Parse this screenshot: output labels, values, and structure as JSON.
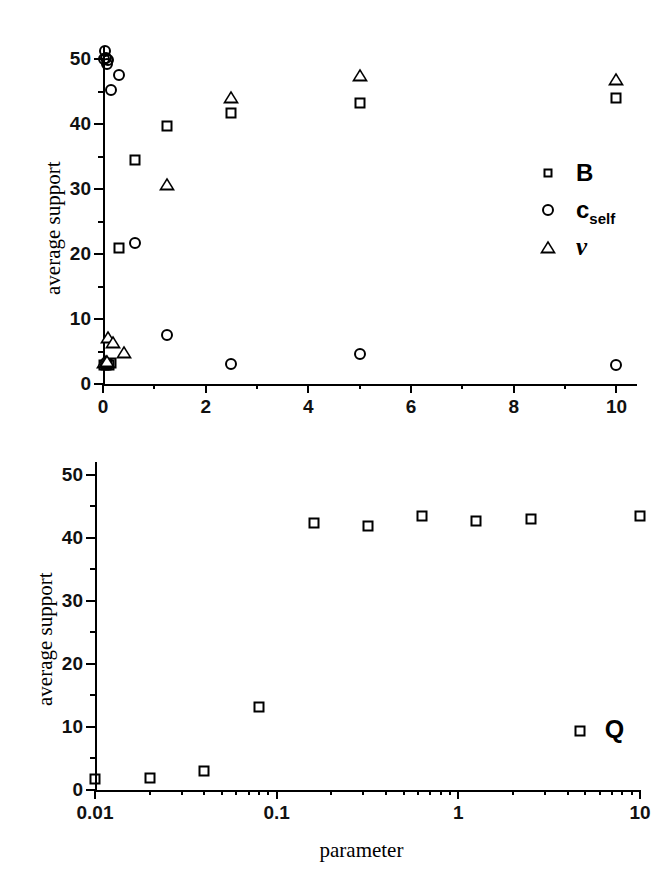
{
  "figure": {
    "panels": [
      {
        "id": "top",
        "ylabel": "average support",
        "xlabel": "",
        "legend": [
          {
            "symbol": "square",
            "label": "B",
            "sub": ""
          },
          {
            "symbol": "circle",
            "label": "c",
            "sub": "self"
          },
          {
            "symbol": "triangle",
            "label": "ν",
            "sub": ""
          }
        ],
        "xticks": [
          "0",
          "2",
          "4",
          "6",
          "8",
          "10"
        ],
        "yticks": [
          "0",
          "10",
          "20",
          "30",
          "40",
          "50"
        ]
      },
      {
        "id": "bottom",
        "ylabel": "average support",
        "xlabel": "parameter",
        "series_tag": "Q",
        "xticks": [
          "0.01",
          "0.1",
          "1",
          "10"
        ],
        "yticks": [
          "0",
          "10",
          "20",
          "30",
          "40",
          "50"
        ]
      }
    ]
  },
  "chart_data": [
    {
      "type": "scatter",
      "panel": "top",
      "title": "",
      "xlabel": "",
      "ylabel": "average support",
      "xscale": "linear",
      "yscale": "linear",
      "xlim": [
        0,
        10.4
      ],
      "ylim": [
        0,
        52
      ],
      "xticks": [
        0,
        2,
        4,
        6,
        8,
        10
      ],
      "yticks": [
        0,
        10,
        20,
        30,
        40,
        50
      ],
      "grid": false,
      "legend_position": "right-middle",
      "series": [
        {
          "name": "B",
          "marker": "square",
          "x": [
            0.02,
            0.05,
            0.08,
            0.12,
            0.16,
            0.31,
            0.62,
            1.25,
            2.5,
            5.0,
            10.0
          ],
          "y": [
            3.0,
            2.9,
            3.1,
            3.0,
            3.2,
            21.0,
            34.5,
            39.7,
            41.7,
            43.2,
            44.0
          ]
        },
        {
          "name": "c_self",
          "marker": "circle",
          "x": [
            0.02,
            0.04,
            0.06,
            0.08,
            0.1,
            0.16,
            0.31,
            0.62,
            1.25,
            2.5,
            5.0,
            10.0
          ],
          "y": [
            50.0,
            51.2,
            50.1,
            49.3,
            49.8,
            45.3,
            47.5,
            21.7,
            7.5,
            3.1,
            4.6,
            2.9
          ]
        },
        {
          "name": "nu",
          "marker": "triangle",
          "x": [
            0.02,
            0.05,
            0.08,
            0.1,
            0.2,
            0.4,
            1.25,
            2.5,
            5.0,
            10.0
          ],
          "y": [
            3.4,
            3.5,
            3.6,
            7.3,
            6.4,
            4.9,
            30.7,
            44.2,
            47.5,
            47.0
          ]
        }
      ]
    },
    {
      "type": "scatter",
      "panel": "bottom",
      "title": "",
      "xlabel": "parameter",
      "ylabel": "average support",
      "xscale": "log",
      "yscale": "linear",
      "xlim": [
        0.01,
        10
      ],
      "ylim": [
        0,
        52
      ],
      "xticks": [
        0.01,
        0.1,
        1,
        10
      ],
      "yticks": [
        0,
        10,
        20,
        30,
        40,
        50
      ],
      "grid": false,
      "series": [
        {
          "name": "Q",
          "marker": "square",
          "x": [
            0.01,
            0.02,
            0.04,
            0.08,
            0.16,
            0.32,
            0.63,
            1.25,
            2.5,
            4.7,
            10.0
          ],
          "y": [
            1.7,
            1.9,
            3.0,
            13.2,
            42.3,
            41.8,
            43.5,
            42.6,
            42.9,
            9.4,
            43.5
          ]
        }
      ]
    }
  ]
}
